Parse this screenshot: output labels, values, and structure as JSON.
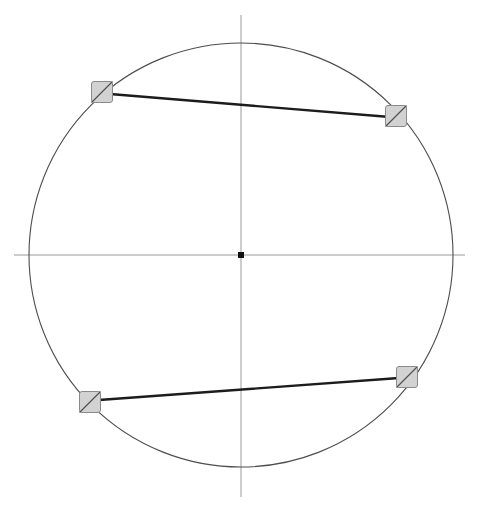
{
  "canvas": {
    "width": 480,
    "height": 512,
    "background": "#ffffff"
  },
  "figure": {
    "title": ""
  },
  "chart_data": {
    "type": "scatter",
    "title": "",
    "subtitle": "",
    "xlabel": "",
    "ylabel": "",
    "grid": false,
    "legend": null,
    "axis_ranges": {
      "x": [
        14,
        465
      ],
      "y": [
        15,
        497
      ]
    },
    "origin": {
      "x": 241,
      "y": 255
    },
    "circle": {
      "cx": 241,
      "cy": 255,
      "r": 212,
      "stroke": "#4d4d4d",
      "stroke_width": 1.1,
      "fill": "none"
    },
    "axes": [
      {
        "name": "horizontal-axis",
        "x1": 14,
        "y1": 255,
        "x2": 465,
        "y2": 255,
        "stroke": "#9a9a9a",
        "stroke_width": 1
      },
      {
        "name": "vertical-axis",
        "x1": 241,
        "y1": 15,
        "x2": 241,
        "y2": 497,
        "stroke": "#9a9a9a",
        "stroke_width": 1
      }
    ],
    "center_point": {
      "name": "center-point",
      "x": 241,
      "y": 255,
      "size": 6,
      "fill": "#111111"
    },
    "markers": [
      {
        "id": "marker-top-left",
        "label": "",
        "x": 102,
        "y": 92,
        "size": 21,
        "fill": "#d2d2d2",
        "stroke": "#8a8a8a"
      },
      {
        "id": "marker-top-right",
        "label": "",
        "x": 396,
        "y": 116,
        "size": 21,
        "fill": "#d2d2d2",
        "stroke": "#8a8a8a"
      },
      {
        "id": "marker-bottom-left",
        "label": "",
        "x": 90,
        "y": 402,
        "size": 21,
        "fill": "#d2d2d2",
        "stroke": "#8a8a8a"
      },
      {
        "id": "marker-bottom-right",
        "label": "",
        "x": 407,
        "y": 377,
        "size": 21,
        "fill": "#d2d2d2",
        "stroke": "#8a8a8a"
      }
    ],
    "chords": [
      {
        "id": "chord-upper",
        "label": "",
        "x1": 110,
        "y1": 94,
        "x2": 390,
        "y2": 117,
        "stroke": "#1c1c1c",
        "stroke_width": 2.3
      },
      {
        "id": "chord-lower",
        "label": "",
        "x1": 99,
        "y1": 400,
        "x2": 399,
        "y2": 378,
        "stroke": "#1c1c1c",
        "stroke_width": 2.3
      }
    ],
    "marker_diagonals": [
      {
        "id": "diagonal-top-left",
        "x1": 91.5,
        "y1": 102.5,
        "x2": 112.5,
        "y2": 81.5
      },
      {
        "id": "diagonal-top-right",
        "x1": 385.5,
        "y1": 126.5,
        "x2": 406.5,
        "y2": 105.5
      },
      {
        "id": "diagonal-bottom-left",
        "x1": 79.5,
        "y1": 412.5,
        "x2": 100.5,
        "y2": 391.5
      },
      {
        "id": "diagonal-bottom-right",
        "x1": 396.5,
        "y1": 387.5,
        "x2": 417.5,
        "y2": 366.5
      }
    ]
  },
  "colors": {
    "background": "#ffffff",
    "circle_stroke": "#4d4d4d",
    "axis_stroke": "#9a9a9a",
    "chord_stroke": "#1c1c1c",
    "marker_fill": "#d2d2d2",
    "marker_stroke": "#8a8a8a",
    "center_fill": "#111111"
  }
}
